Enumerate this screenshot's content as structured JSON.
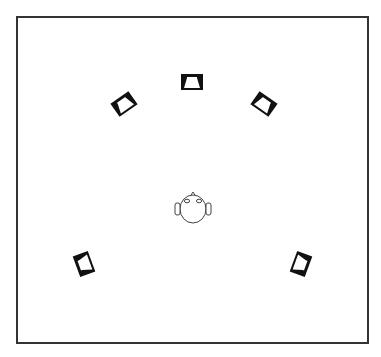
{
  "diagram": {
    "type": "speaker-layout",
    "layout_name": "5-speaker surround",
    "colors": {
      "frame": "#333333",
      "speaker_body": "#111111",
      "speaker_horn": "#ffffff",
      "head_outline": "#444444",
      "background": "#ffffff"
    },
    "listener": {
      "label": "listener-head",
      "x": 193,
      "y": 209,
      "radius": 13
    },
    "speakers": [
      {
        "id": "center",
        "label": "Center",
        "x": 192,
        "y": 82,
        "rotation": 0
      },
      {
        "id": "front-left",
        "label": "Front Left",
        "x": 124,
        "y": 104,
        "rotation": -35
      },
      {
        "id": "front-right",
        "label": "Front Right",
        "x": 264,
        "y": 104,
        "rotation": 35
      },
      {
        "id": "surround-left",
        "label": "Surround Left",
        "x": 84,
        "y": 264,
        "rotation": -110
      },
      {
        "id": "surround-right",
        "label": "Surround Right",
        "x": 301,
        "y": 264,
        "rotation": 110
      }
    ]
  }
}
